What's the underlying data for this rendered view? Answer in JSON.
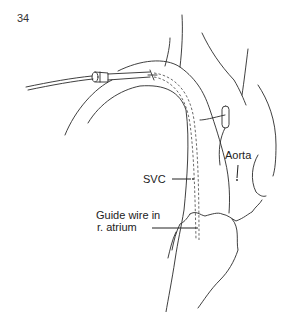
{
  "figure": {
    "number": "34",
    "labels": {
      "svc": "SVC",
      "aorta": "Aorta",
      "guide_wire_line1": "Guide wire in",
      "guide_wire_line2": "r. atrium"
    }
  }
}
